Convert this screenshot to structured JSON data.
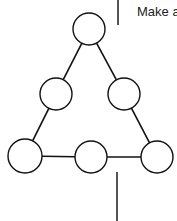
{
  "caption": "Make a",
  "colors": {
    "stroke": "#111111",
    "fill": "#ffffff",
    "bar": "#555555"
  },
  "diagram": {
    "type": "triangle-of-circles",
    "nodes": [
      {
        "id": "top",
        "cx": 89,
        "cy": 29,
        "r": 16
      },
      {
        "id": "mid-left",
        "cx": 56,
        "cy": 94,
        "r": 16
      },
      {
        "id": "mid-right",
        "cx": 124,
        "cy": 94,
        "r": 16
      },
      {
        "id": "bottom-left",
        "cx": 25,
        "cy": 156,
        "r": 17
      },
      {
        "id": "bottom-middle",
        "cx": 91,
        "cy": 157,
        "r": 16
      },
      {
        "id": "bottom-right",
        "cx": 157,
        "cy": 157,
        "r": 16
      }
    ],
    "edges": [
      [
        "top",
        "mid-left"
      ],
      [
        "mid-left",
        "bottom-left"
      ],
      [
        "top",
        "mid-right"
      ],
      [
        "mid-right",
        "bottom-right"
      ],
      [
        "bottom-left",
        "bottom-middle"
      ],
      [
        "bottom-middle",
        "bottom-right"
      ]
    ]
  }
}
